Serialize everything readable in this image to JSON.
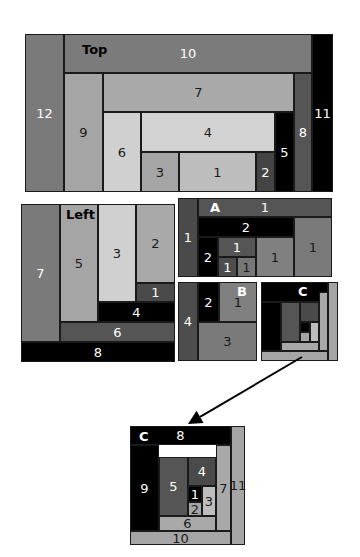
{
  "diagram": {
    "panels": [
      {
        "id": "top",
        "label": "Top",
        "label_pos": [
          82,
          43
        ],
        "label_color": "#000000",
        "cells": [
          {
            "text": "12",
            "x": 25,
            "y": 34,
            "w": 39,
            "h": 158,
            "bg": "#7a7a7a",
            "fg": "#ffffff"
          },
          {
            "text": "10",
            "x": 64,
            "y": 34,
            "w": 248,
            "h": 39,
            "bg": "#7b7b7b",
            "fg": "#ffffff"
          },
          {
            "text": "11",
            "x": 312,
            "y": 34,
            "w": 21,
            "h": 158,
            "bg": "#000000",
            "fg": "#ffffff"
          },
          {
            "text": "9",
            "x": 64,
            "y": 73,
            "w": 39,
            "h": 119,
            "bg": "#a5a5a5",
            "fg": "#1a1a1a"
          },
          {
            "text": "7",
            "x": 103,
            "y": 73,
            "w": 191,
            "h": 39,
            "bg": "#a9a9a9",
            "fg": "#1a1a1a"
          },
          {
            "text": "8",
            "x": 294,
            "y": 73,
            "w": 18,
            "h": 119,
            "bg": "#555555",
            "fg": "#ffffff"
          },
          {
            "text": "6",
            "x": 103,
            "y": 112,
            "w": 38,
            "h": 80,
            "bg": "#d0d0d0",
            "fg": "#1a1a1a"
          },
          {
            "text": "4",
            "x": 141,
            "y": 112,
            "w": 134,
            "h": 40,
            "bg": "#d2d2d2",
            "fg": "#1a1a1a"
          },
          {
            "text": "5",
            "x": 275,
            "y": 112,
            "w": 19,
            "h": 80,
            "bg": "#000000",
            "fg": "#ffffff"
          },
          {
            "text": "3",
            "x": 141,
            "y": 152,
            "w": 38,
            "h": 40,
            "bg": "#a5a5a5",
            "fg": "#1a1a1a"
          },
          {
            "text": "1",
            "x": 179,
            "y": 152,
            "w": 77,
            "h": 40,
            "bg": "#bdbdbd",
            "fg": "#1a1a1a"
          },
          {
            "text": "2",
            "x": 256,
            "y": 152,
            "w": 19,
            "h": 40,
            "bg": "#444444",
            "fg": "#ffffff"
          }
        ]
      },
      {
        "id": "left",
        "label": "Left",
        "label_pos": [
          66,
          208
        ],
        "label_color": "#000000",
        "cells": [
          {
            "text": "7",
            "x": 21,
            "y": 204,
            "w": 39,
            "h": 138,
            "bg": "#7a7a7a",
            "fg": "#ffffff"
          },
          {
            "text": "5",
            "x": 60,
            "y": 204,
            "w": 38,
            "h": 118,
            "bg": "#a5a5a5",
            "fg": "#1a1a1a"
          },
          {
            "text": "3",
            "x": 98,
            "y": 204,
            "w": 38,
            "h": 98,
            "bg": "#d0d0d0",
            "fg": "#1a1a1a"
          },
          {
            "text": "2",
            "x": 136,
            "y": 204,
            "w": 39,
            "h": 79,
            "bg": "#a9a9a9",
            "fg": "#1a1a1a"
          },
          {
            "text": "1",
            "x": 136,
            "y": 283,
            "w": 39,
            "h": 19,
            "bg": "#4a4a4a",
            "fg": "#ffffff"
          },
          {
            "text": "4",
            "x": 98,
            "y": 302,
            "w": 77,
            "h": 20,
            "bg": "#000000",
            "fg": "#ffffff"
          },
          {
            "text": "6",
            "x": 60,
            "y": 322,
            "w": 115,
            "h": 20,
            "bg": "#555555",
            "fg": "#ffffff"
          },
          {
            "text": "8",
            "x": 21,
            "y": 342,
            "w": 154,
            "h": 20,
            "bg": "#000000",
            "fg": "#ffffff"
          }
        ]
      },
      {
        "id": "a",
        "label": "A",
        "label_pos": [
          210,
          201
        ],
        "label_color": "#ffffff",
        "cells": [
          {
            "text": "1",
            "x": 178,
            "y": 198,
            "w": 20,
            "h": 79,
            "bg": "#4a4a4a",
            "fg": "#ffffff"
          },
          {
            "text": "1",
            "x": 198,
            "y": 198,
            "w": 134,
            "h": 19,
            "bg": "#555555",
            "fg": "#ffffff"
          },
          {
            "text": "2",
            "x": 198,
            "y": 217,
            "w": 96,
            "h": 20,
            "bg": "#000000",
            "fg": "#ffffff"
          },
          {
            "text": "1",
            "x": 294,
            "y": 217,
            "w": 38,
            "h": 60,
            "bg": "#7a7a7a",
            "fg": "#1a1a1a"
          },
          {
            "text": "2",
            "x": 198,
            "y": 237,
            "w": 20,
            "h": 40,
            "bg": "#000000",
            "fg": "#ffffff"
          },
          {
            "text": "1",
            "x": 218,
            "y": 237,
            "w": 38,
            "h": 20,
            "bg": "#555555",
            "fg": "#ffffff"
          },
          {
            "text": "1",
            "x": 256,
            "y": 237,
            "w": 38,
            "h": 40,
            "bg": "#808080",
            "fg": "#1a1a1a"
          },
          {
            "text": "1",
            "x": 218,
            "y": 257,
            "w": 19,
            "h": 20,
            "bg": "#4d4d4d",
            "fg": "#ffffff"
          },
          {
            "text": "1",
            "x": 237,
            "y": 257,
            "w": 19,
            "h": 20,
            "bg": "#777777",
            "fg": "#1a1a1a"
          }
        ]
      },
      {
        "id": "b",
        "label": "B",
        "label_pos": [
          237,
          285
        ],
        "label_color": "#ffffff",
        "cells": [
          {
            "text": "4",
            "x": 178,
            "y": 282,
            "w": 20,
            "h": 79,
            "bg": "#4d4d4d",
            "fg": "#ffffff"
          },
          {
            "text": "2",
            "x": 198,
            "y": 282,
            "w": 21,
            "h": 40,
            "bg": "#000000",
            "fg": "#ffffff"
          },
          {
            "text": "1",
            "x": 219,
            "y": 282,
            "w": 38,
            "h": 40,
            "bg": "#808080",
            "fg": "#1a1a1a"
          },
          {
            "text": "3",
            "x": 198,
            "y": 322,
            "w": 59,
            "h": 39,
            "bg": "#7a7a7a",
            "fg": "#1a1a1a"
          }
        ]
      },
      {
        "id": "c-small",
        "label": "C",
        "label_pos": [
          298,
          285
        ],
        "label_color": "#ffffff",
        "cells": [
          {
            "text": "",
            "x": 261,
            "y": 282,
            "w": 67,
            "h": 20,
            "bg": "#000000",
            "fg": "#ffffff"
          },
          {
            "text": "",
            "x": 261,
            "y": 302,
            "w": 20,
            "h": 49,
            "bg": "#000000",
            "fg": "#ffffff"
          },
          {
            "text": "",
            "x": 328,
            "y": 282,
            "w": 10,
            "h": 79,
            "bg": "#a5a5a5",
            "fg": "#1a1a1a"
          },
          {
            "text": "",
            "x": 261,
            "y": 351,
            "w": 67,
            "h": 10,
            "bg": "#a5a5a5",
            "fg": "#1a1a1a"
          },
          {
            "text": "",
            "x": 319,
            "y": 292,
            "w": 9,
            "h": 59,
            "bg": "#a9a9a9",
            "fg": "#1a1a1a"
          },
          {
            "text": "",
            "x": 281,
            "y": 342,
            "w": 38,
            "h": 9,
            "bg": "#a9a9a9",
            "fg": "#1a1a1a"
          },
          {
            "text": "",
            "x": 281,
            "y": 302,
            "w": 19,
            "h": 40,
            "bg": "#555555",
            "fg": "#ffffff"
          },
          {
            "text": "",
            "x": 300,
            "y": 302,
            "w": 19,
            "h": 20,
            "bg": "#4a4a4a",
            "fg": "#ffffff"
          },
          {
            "text": "",
            "x": 300,
            "y": 322,
            "w": 10,
            "h": 10,
            "bg": "#000000",
            "fg": "#ffffff"
          },
          {
            "text": "",
            "x": 300,
            "y": 332,
            "w": 10,
            "h": 10,
            "bg": "#a5a5a5",
            "fg": "#1a1a1a"
          },
          {
            "text": "",
            "x": 310,
            "y": 322,
            "w": 9,
            "h": 20,
            "bg": "#bdbdbd",
            "fg": "#1a1a1a"
          }
        ]
      },
      {
        "id": "c-large",
        "label": "C",
        "label_pos": [
          139,
          430
        ],
        "label_color": "#ffffff",
        "cells": [
          {
            "text": "8",
            "x": 130,
            "y": 426,
            "w": 101,
            "h": 19,
            "bg": "#000000",
            "fg": "#ffffff"
          },
          {
            "text": "9",
            "x": 130,
            "y": 445,
            "w": 29,
            "h": 86,
            "bg": "#000000",
            "fg": "#ffffff"
          },
          {
            "text": "11",
            "x": 231,
            "y": 426,
            "w": 14,
            "h": 119,
            "bg": "#a5a5a5",
            "fg": "#1a1a1a"
          },
          {
            "text": "10",
            "x": 130,
            "y": 531,
            "w": 101,
            "h": 14,
            "bg": "#a5a5a5",
            "fg": "#1a1a1a"
          },
          {
            "text": "7",
            "x": 216,
            "y": 445,
            "w": 15,
            "h": 86,
            "bg": "#a9a9a9",
            "fg": "#1a1a1a"
          },
          {
            "text": "6",
            "x": 159,
            "y": 516,
            "w": 57,
            "h": 15,
            "bg": "#a9a9a9",
            "fg": "#1a1a1a"
          },
          {
            "text": "5",
            "x": 159,
            "y": 457,
            "w": 29,
            "h": 59,
            "bg": "#555555",
            "fg": "#ffffff"
          },
          {
            "text": "4",
            "x": 188,
            "y": 457,
            "w": 28,
            "h": 29,
            "bg": "#4a4a4a",
            "fg": "#ffffff"
          },
          {
            "text": "1",
            "x": 188,
            "y": 486,
            "w": 14,
            "h": 16,
            "bg": "#000000",
            "fg": "#ffffff"
          },
          {
            "text": "2",
            "x": 188,
            "y": 502,
            "w": 14,
            "h": 14,
            "bg": "#a5a5a5",
            "fg": "#1a1a1a"
          },
          {
            "text": "3",
            "x": 202,
            "y": 486,
            "w": 14,
            "h": 30,
            "bg": "#bdbdbd",
            "fg": "#1a1a1a"
          }
        ]
      }
    ],
    "arrow": {
      "from": [
        302,
        357
      ],
      "to": [
        188,
        424
      ],
      "color": "#000000",
      "label": "zoom-arrow"
    }
  }
}
